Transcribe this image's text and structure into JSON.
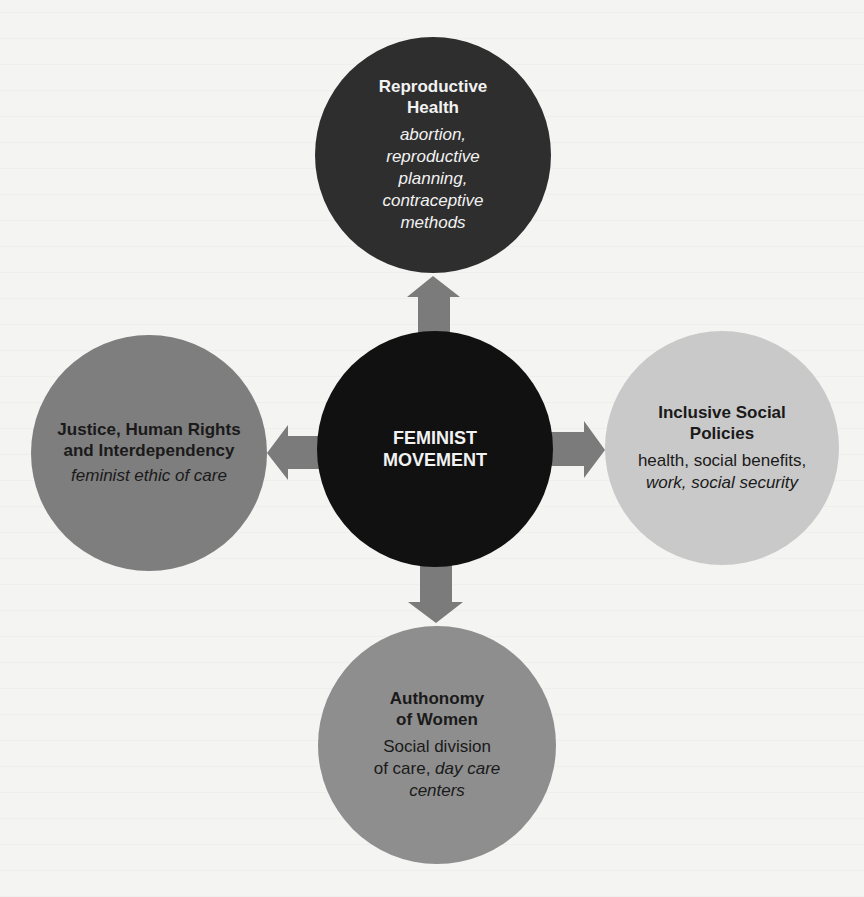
{
  "diagram": {
    "type": "hub-and-spoke",
    "colors": {
      "background": "#f4f4f2",
      "arrow": "#7b7b7b",
      "center": "#111111",
      "top": "#2e2e2e",
      "left": "#7e7e7e",
      "right": "#c9c9c9",
      "bottom": "#8e8e8e"
    },
    "center": {
      "title_line1": "FEMINIST",
      "title_line2": "MOVEMENT"
    },
    "top": {
      "title_line1": "Reproductive",
      "title_line2": "Health",
      "sub_line1": "abortion,",
      "sub_line2": "reproductive",
      "sub_line3": "planning,",
      "sub_line4": "contraceptive",
      "sub_line5": "methods"
    },
    "left": {
      "title_line1": "Justice, Human Rights",
      "title_line2": "and Interdependency",
      "sub_line1": "feminist ethic of care"
    },
    "right": {
      "title_line1": "Inclusive Social",
      "title_line2": "Policies",
      "sub_line1": "health,  social benefits,",
      "sub_line2": "work, social security"
    },
    "bottom": {
      "title_line1": "Authonomy",
      "title_line2": "of Women",
      "sub_line1": "Social division",
      "sub_line2_plain": "of care, ",
      "sub_line2_italic": "day care",
      "sub_line3": "centers"
    },
    "edges": [
      {
        "from": "center",
        "to": "top"
      },
      {
        "from": "center",
        "to": "left"
      },
      {
        "from": "center",
        "to": "right"
      },
      {
        "from": "center",
        "to": "bottom"
      }
    ]
  }
}
